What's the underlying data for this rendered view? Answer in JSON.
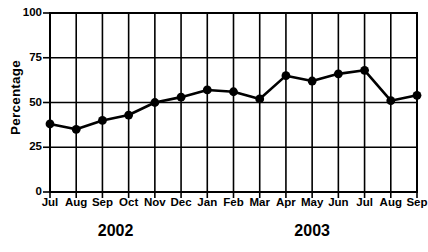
{
  "chart_data": {
    "type": "line",
    "title": "",
    "xlabel": "",
    "ylabel": "Percentage",
    "ylim": [
      0,
      100
    ],
    "yticks": [
      0,
      25,
      50,
      75,
      100
    ],
    "ytick_labels": [
      "0",
      "25",
      "50",
      "75",
      "100"
    ],
    "grid": true,
    "grid_axes": "both",
    "legend": "none",
    "marker": "filled-circle",
    "line_color": "#000000",
    "marker_color": "#000000",
    "frame_color": "#000000",
    "background_color": "#ffffff",
    "categories": [
      "Jul",
      "Aug",
      "Sep",
      "Oct",
      "Nov",
      "Dec",
      "Jan",
      "Feb",
      "Mar",
      "Apr",
      "May",
      "Jun",
      "Jul",
      "Aug",
      "Sep"
    ],
    "values": [
      38,
      35,
      40,
      43,
      50,
      53,
      57,
      56,
      52,
      65,
      62,
      66,
      68,
      51,
      54
    ],
    "groups": [
      {
        "label": "2002",
        "start_index": 0,
        "end_index": 5
      },
      {
        "label": "2003",
        "start_index": 6,
        "end_index": 14
      }
    ]
  }
}
